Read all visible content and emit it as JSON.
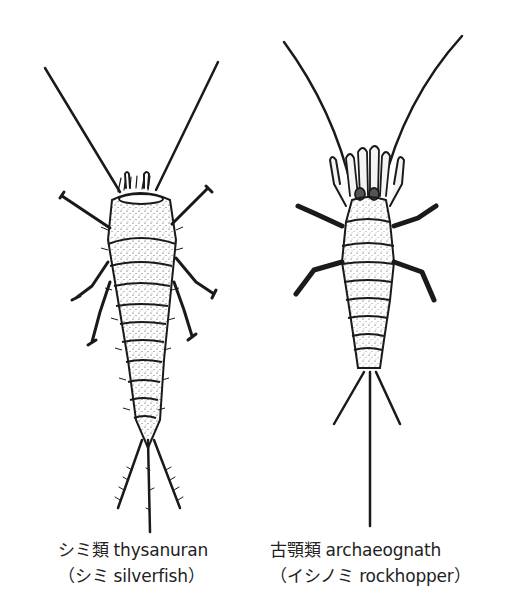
{
  "figure": {
    "panels": [
      {
        "id": "thysanuran",
        "illustration": "silverfish-drawing",
        "caption": {
          "line1": "シミ類 thysanuran",
          "line2": "（シミ silverfish）"
        }
      },
      {
        "id": "archaeognath",
        "illustration": "rockhopper-drawing",
        "caption": {
          "line1": "古顎類 archaeognath",
          "line2": "（イシノミ rockhopper）"
        }
      }
    ],
    "colors": {
      "ink": "#1a1a1a",
      "background": "#ffffff",
      "body_fill": "#f4f4f4"
    }
  }
}
